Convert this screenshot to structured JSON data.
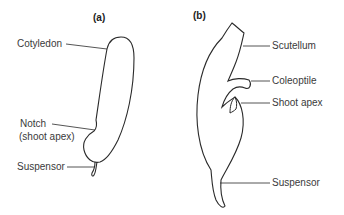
{
  "panels": [
    {
      "id": "a",
      "label": "(a)",
      "labels": {
        "cotyledon": "Cotyledon",
        "notch_line1": "Notch",
        "notch_line2": "(shoot apex)",
        "suspensor": "Suspensor"
      }
    },
    {
      "id": "b",
      "label": "(b)",
      "labels": {
        "scutellum": "Scutellum",
        "coleoptile": "Coleoptile",
        "shoot_apex": "Shoot apex",
        "suspensor": "Suspensor"
      }
    }
  ],
  "colors": {
    "stroke": "#2a2a2a",
    "text": "#3a3a3a",
    "background": "#ffffff"
  }
}
